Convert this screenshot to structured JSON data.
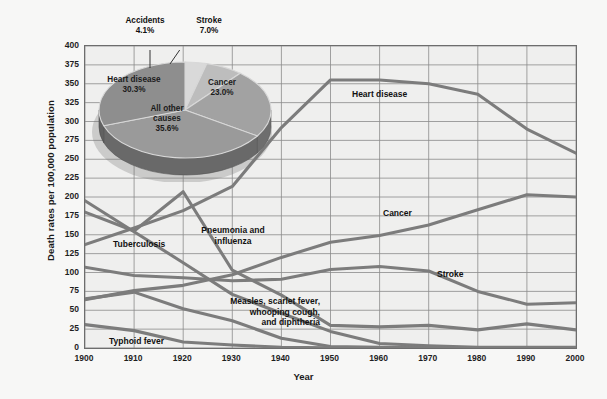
{
  "chart_data": {
    "type": "line",
    "title": "",
    "xlabel": "Year",
    "ylabel": "Death rates per 100,000 population",
    "xlim": [
      1900,
      2000
    ],
    "ylim": [
      0,
      400
    ],
    "grid": true,
    "legend_position": "inline-labels",
    "x": [
      1900,
      1910,
      1920,
      1930,
      1940,
      1950,
      1960,
      1970,
      1980,
      1990,
      2000
    ],
    "xticks": [
      "1900",
      "1910",
      "1920",
      "1930",
      "1940",
      "1950",
      "1960",
      "1970",
      "1980",
      "1990",
      "2000"
    ],
    "yticks": [
      "0",
      "25",
      "50",
      "75",
      "100",
      "125",
      "150",
      "175",
      "200",
      "225",
      "250",
      "275",
      "300",
      "325",
      "350",
      "375",
      "400"
    ],
    "series": [
      {
        "name": "Heart disease",
        "label": "Heart disease",
        "values": [
          137,
          159,
          182,
          214,
          292,
          355,
          355,
          350,
          336,
          290,
          258
        ]
      },
      {
        "name": "Cancer",
        "label": "Cancer",
        "values": [
          64,
          76,
          83,
          97,
          120,
          140,
          149,
          163,
          183,
          203,
          200
        ]
      },
      {
        "name": "Stroke",
        "label": "Stroke",
        "values": [
          107,
          96,
          93,
          89,
          91,
          104,
          108,
          102,
          75,
          58,
          60
        ]
      },
      {
        "name": "Pneumonia and influenza",
        "label": "Pneumonia and\ninfluenza",
        "values": [
          180,
          155,
          207,
          103,
          70,
          30,
          28,
          30,
          24,
          32,
          24
        ]
      },
      {
        "name": "Tuberculosis",
        "label": "Tuberculosis",
        "values": [
          195,
          154,
          113,
          71,
          46,
          22,
          6,
          3,
          1,
          1,
          1
        ]
      },
      {
        "name": "Measles, scarlet fever, whooping cough, and diphtheria",
        "label": "Measles, scarlet fever,\nwhooping cough,\nand diphtheria",
        "values": [
          65,
          74,
          52,
          36,
          13,
          2,
          1,
          0.5,
          0.3,
          0.2,
          0.1
        ]
      },
      {
        "name": "Typhoid fever",
        "label": "Typhoid fever",
        "values": [
          31,
          23,
          8,
          4,
          1,
          0.3,
          0.1,
          0.05,
          0.03,
          0.02,
          0.01
        ]
      }
    ]
  },
  "pie_chart": {
    "type": "pie",
    "title": "",
    "slices": [
      {
        "label": "Heart disease",
        "value": 30.3,
        "value_text": "30.3%"
      },
      {
        "label": "Accidents",
        "value": 4.1,
        "value_text": "4.1%"
      },
      {
        "label": "Stroke",
        "value": 7.0,
        "value_text": "7.0%"
      },
      {
        "label": "Cancer",
        "value": 23.0,
        "value_text": "23.0%"
      },
      {
        "label": "All other\ncauses",
        "value": 35.6,
        "value_text": "35.6%"
      }
    ]
  },
  "axes": {
    "y_title": "Death rates per 100,000 population",
    "x_title": "Year"
  },
  "ticks": {
    "y": [
      "400",
      "375",
      "350",
      "325",
      "300",
      "275",
      "250",
      "225",
      "200",
      "175",
      "150",
      "125",
      "100",
      "75",
      "50",
      "25",
      "0"
    ],
    "x": [
      "1900",
      "1910",
      "1920",
      "1930",
      "1940",
      "1950",
      "1960",
      "1970",
      "1980",
      "1990",
      "2000"
    ]
  },
  "series_labels": {
    "heart_disease": "Heart disease",
    "cancer": "Cancer",
    "stroke": "Stroke",
    "pneumonia": "Pneumonia and\ninfluenza",
    "tuberculosis": "Tuberculosis",
    "measles": "Measles, scarlet fever,\nwhooping cough,\nand diphtheria",
    "typhoid": "Typhoid fever"
  },
  "pie_labels": {
    "accidents_name": "Accidents",
    "accidents_pct": "4.1%",
    "stroke_name": "Stroke",
    "stroke_pct": "7.0%",
    "heart_name": "Heart disease",
    "heart_pct": "30.3%",
    "cancer_name": "Cancer",
    "cancer_pct": "23.0%",
    "other_name": "All other\ncauses",
    "other_pct": "35.6%"
  },
  "colors": {
    "plot_bg": "#efefee",
    "page_bg": "#f7f7f6",
    "grid": "#8a8a8a",
    "frame": "#6d6d6d",
    "line": "#7c7c7c",
    "pie_heart": "#8e8e8e",
    "pie_accidents": "#d9d9d9",
    "pie_stroke": "#bdbdbd",
    "pie_cancer": "#a2a2a2",
    "pie_other": "#9a9a9a",
    "pie_side": "#6f6f6f",
    "text": "#111111"
  }
}
